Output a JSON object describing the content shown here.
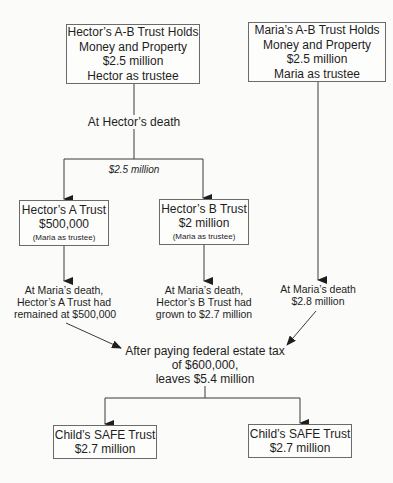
{
  "diagram": {
    "hector_ab_trust": {
      "lines": [
        "Hector’s A-B Trust Holds",
        "Money and Property",
        "$2.5 million",
        "Hector as trustee"
      ]
    },
    "maria_ab_trust": {
      "lines": [
        "Maria’s A-B Trust Holds",
        "Money and Property",
        "$2.5 million",
        "Maria as trustee"
      ]
    },
    "event_hector_death": "At Hector’s death",
    "split_amount": "$2.5 million",
    "hector_a_trust": {
      "title": "Hector’s A Trust",
      "amount": "$500,000",
      "note": "(Maria as trustee)"
    },
    "hector_b_trust": {
      "title": "Hector’s B Trust",
      "amount": "$2 million",
      "note": "(Maria as trustee)"
    },
    "a_trust_at_maria_death": [
      "At Maria’s death,",
      "Hector’s A Trust had",
      "remained at $500,000"
    ],
    "b_trust_at_maria_death": [
      "At Maria’s death,",
      "Hector’s B Trust had",
      "grown to $2.7 million"
    ],
    "maria_trust_at_death": [
      "At Maria’s death",
      "$2.8 million"
    ],
    "after_tax": [
      "After paying federal estate tax",
      "of $600,000,",
      "leaves $5.4 million"
    ],
    "child_trust_1": {
      "title": "Child’s SAFE Trust",
      "amount": "$2.7 million"
    },
    "child_trust_2": {
      "title": "Child’s SAFE Trust",
      "amount": "$2.7 million"
    }
  }
}
